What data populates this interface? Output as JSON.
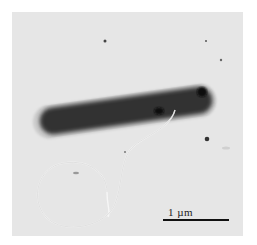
{
  "figure": {
    "type": "transmission electron micrograph",
    "scale_bar": {
      "label": "1 µm"
    },
    "colors": {
      "background": "#e6e6e6",
      "cell_body": "#2e2e2e",
      "cell_halo": "#cfcfcf",
      "flagellum": "#f4f4f4"
    }
  }
}
